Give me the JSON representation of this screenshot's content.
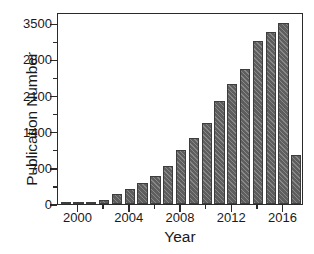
{
  "chart_data": {
    "type": "bar",
    "title": "",
    "xlabel": "Year",
    "ylabel": "Publication Number",
    "categories": [
      1999,
      2000,
      2001,
      2002,
      2003,
      2004,
      2005,
      2006,
      2007,
      2008,
      2009,
      2010,
      2011,
      2012,
      2013,
      2014,
      2015,
      2016,
      2017
    ],
    "values": [
      8,
      15,
      40,
      70,
      200,
      300,
      400,
      550,
      740,
      1050,
      1280,
      1570,
      2000,
      2330,
      2620,
      3150,
      3340,
      3510,
      950
    ],
    "xlim": [
      1998.4,
      2017.6
    ],
    "ylim": [
      0,
      3720
    ],
    "y_ticks_major": [
      0,
      700,
      1400,
      2100,
      2800,
      3500
    ],
    "y_ticks_major_labels": [
      "0",
      "700",
      "1400",
      "2100",
      "2800",
      "3500"
    ],
    "y_ticks_minor": [
      350,
      1050,
      1750,
      2450,
      3150
    ],
    "x_ticks_major": [
      2000,
      2004,
      2008,
      2012,
      2016
    ],
    "x_ticks_major_labels": [
      "2000",
      "2004",
      "2008",
      "2012",
      "2016"
    ],
    "x_ticks_minor": [
      2002,
      2006,
      2010,
      2014
    ],
    "grid": false,
    "legend": null,
    "bar_color": "#5e5e5e",
    "bar_edge_color": "#3d3d3d",
    "bar_hatch": "diagonal-lines",
    "axis_color": "#2b2b2b",
    "background_color": "#ffffff"
  }
}
